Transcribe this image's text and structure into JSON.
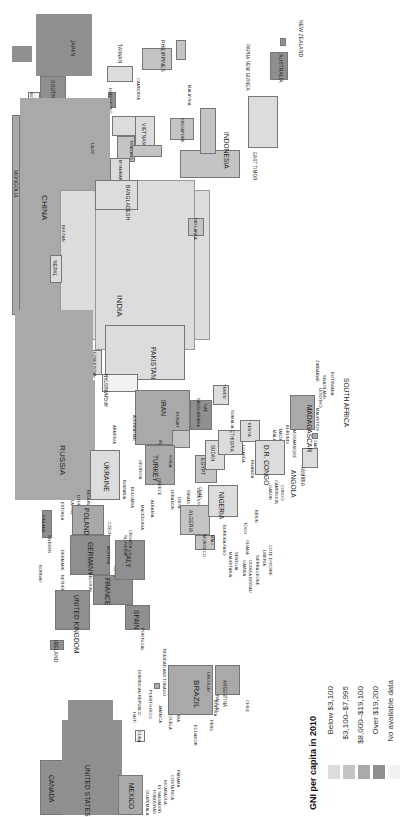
{
  "map": {
    "orientation": "rotated-90-ccw",
    "legend": {
      "title": "GNI per capita in 2010",
      "items": [
        {
          "label": "Below $3,100",
          "color": "#dcdcdc"
        },
        {
          "label": "$3,100–$7,995",
          "color": "#c4c4c4"
        },
        {
          "label": "$8,000–$19,100",
          "color": "#a9a9a9"
        },
        {
          "label": "Over $19,200",
          "color": "#8f8f8f"
        },
        {
          "label": "No available data",
          "color": "#f2f2f2"
        }
      ]
    },
    "regions": {
      "east_asia": [
        "JAPAN",
        "SOUTH KOREA",
        "NORTH KOREA",
        "TAIWAN",
        "HONG KONG",
        "PHILIPPINES",
        "CHINA",
        "MONGOLIA"
      ],
      "southeast_asia": [
        "CAMBODIA",
        "VIETNAM",
        "LAOS",
        "THAILAND",
        "MYANMAR",
        "MALAYSIA",
        "SINGAPORE",
        "INDONESIA",
        "EAST TIMOR",
        "PAPUA NEW GUINEA"
      ],
      "oceania": [
        "AUSTRALIA",
        "NEW ZEALAND"
      ],
      "south_asia": [
        "INDIA",
        "BANGLADESH",
        "NEPAL",
        "BHUTAN",
        "SRI LANKA",
        "PAKISTAN",
        "AFGHANISTAN"
      ],
      "central_asia": [
        "KAZAKHSTAN",
        "KYRGYZSTAN",
        "TAJIKISTAN",
        "UZBEKISTAN",
        "TURKMENISTAN"
      ],
      "middle_east": [
        "IRAN",
        "IRAQ",
        "KUWAIT",
        "SAUDI ARABIA",
        "UAE",
        "OMAN",
        "YEMEN",
        "JORDAN",
        "SYRIA",
        "LEBANON",
        "ISRAEL",
        "GAZA STRIP",
        "WEST BANK",
        "TURKEY",
        "GEORGIA",
        "ARMENIA",
        "AZERBAIJAN"
      ],
      "europe": [
        "RUSSIA",
        "UKRAINE",
        "BELARUS",
        "LITHUANIA",
        "LATVIA",
        "ESTONIA",
        "FINLAND",
        "SWEDEN",
        "NORWAY",
        "DENMARK",
        "POLAND",
        "GERMANY",
        "NETHERLANDS",
        "BELGIUM",
        "UNITED KINGDOM",
        "IRELAND",
        "FRANCE",
        "SWITZERLAND",
        "AUSTRIA",
        "CZECH",
        "HUNGARY",
        "ROMANIA",
        "BULGARIA",
        "MOLDOVA",
        "SERBIA",
        "BOSNIA",
        "CROATIA",
        "SLOVENIA",
        "MACEDONIA",
        "ALBANIA",
        "GREECE",
        "ITALY",
        "SPAIN",
        "PORTUGAL"
      ],
      "africa": [
        "EGYPT",
        "LIBYA",
        "TUNISIA",
        "ALGERIA",
        "MOROCCO",
        "MAURITANIA",
        "MALI",
        "NIGER",
        "CHAD",
        "SUDAN",
        "ERITREA",
        "ETHIOPIA",
        "SOMALIA",
        "KENYA",
        "UGANDA",
        "RWANDA",
        "BURUNDI",
        "TANZANIA",
        "MALAWI",
        "MOZAMBIQUE",
        "ZAMBIA",
        "ZIMBABWE",
        "BOTSWANA",
        "NAMIBIA",
        "SOUTH AFRICA",
        "LESOTHO",
        "SWAZILAND",
        "MADAGASCAR",
        "MAURITIUS",
        "ANGOLA",
        "D.R. CONGO",
        "CONGO",
        "GABON",
        "CAMEROON",
        "NIGERIA",
        "BENIN",
        "TOGO",
        "GHANA",
        "COTE D'IVOIRE",
        "LIBERIA",
        "SIERRA LEONE",
        "GUINEA",
        "GUINEA-BISSAU",
        "GAMBIA",
        "SENEGAL",
        "BURKINA FASO"
      ],
      "americas": [
        "CANADA",
        "UNITED STATES",
        "MEXICO",
        "GUATEMALA",
        "HONDURAS",
        "EL SALVADOR",
        "NICARAGUA",
        "COSTA RICA",
        "PANAMA",
        "CUBA",
        "HAITI",
        "DOMINICAN REPUBLIC",
        "PUERTO RICO",
        "JAMAICA",
        "TRINIDAD AND TOBAGO",
        "VENEZUELA",
        "COLOMBIA",
        "ECUADOR",
        "PERU",
        "BOLIVIA",
        "BRAZIL",
        "PARAGUAY",
        "URUGUAY",
        "ARGENTINA",
        "CHILE"
      ]
    },
    "labels": {
      "japan": "JAPAN",
      "south_korea": "SOUTH KOREA",
      "north_korea": "NORTH KOREA",
      "taiwan": "TAIWAN",
      "hong_kong": "HONG KONG",
      "philippines": "PHILIPPINES",
      "cambodia": "CAMBODIA",
      "vietnam": "VIETNAM",
      "laos": "LAOS",
      "thailand": "THAILAND",
      "myanmar": "MYANMAR",
      "malaysia": "MALAYSIA",
      "singapore": "SINGAPORE",
      "indonesia": "INDONESIA",
      "east_timor": "EAST TIMOR",
      "png": "PAPUA NEW GUINEA",
      "australia": "AUSTRALIA",
      "new_zealand": "NEW ZEALAND",
      "china": "CHINA",
      "mongolia": "MONGOLIA",
      "india": "INDIA",
      "bangladesh": "BANGLADESH",
      "nepal": "NEPAL",
      "bhutan": "BHUTAN",
      "sri_lanka": "SRI LANKA",
      "pakistan": "PAKISTAN",
      "afghanistan": "AFGHANISTAN",
      "kazakhstan": "KAZAKHSTAN",
      "kyrgyzstan": "KYRGYZSTAN",
      "tajikistan": "TAJIKISTAN",
      "uzbekistan": "UZBEKISTAN",
      "turkmenistan": "TURKMENISTAN",
      "russia": "RUSSIA",
      "iran": "IRAN",
      "iraq": "IRAQ",
      "kuwait": "KUWAIT",
      "saudi_arabia": "SAUDI ARABIA",
      "uae": "UAE",
      "oman": "OMAN",
      "yemen": "YEMEN",
      "jordan": "JORDAN",
      "syria": "SYRIA",
      "lebanon": "LEBANON",
      "israel": "ISRAEL",
      "gaza": "GAZA STRIP",
      "west_bank": "WEST BANK",
      "turkey": "TURKEY",
      "georgia": "GEORGIA",
      "armenia": "ARMENIA",
      "azerbaijan": "AZERBAIJAN",
      "ukraine": "UKRAINE",
      "belarus": "BELARUS",
      "lithuania": "LITHUANIA",
      "latvia": "LATVIA",
      "estonia": "ESTONIA",
      "finland": "FINLAND",
      "sweden": "SWEDEN",
      "norway": "NORWAY",
      "denmark": "DENMARK",
      "poland": "POLAND",
      "germany": "GERMANY",
      "netherlands": "NETHERLANDS",
      "belgium": "BELGIUM",
      "uk": "UNITED KINGDOM",
      "ireland": "IRELAND",
      "france": "FRANCE",
      "switzerland": "SWITZ.",
      "austria": "AUSTRIA",
      "czech": "CZECH",
      "hungary": "HUNGARY",
      "romania": "ROMANIA",
      "bulgaria": "BULGARIA",
      "moldova": "MOLDOVA",
      "serbia": "SERBIA",
      "croatia": "CROATIA",
      "slovenia": "SLOVENIA",
      "macedonia": "MACEDONIA",
      "albania": "ALBANIA",
      "greece": "GREECE",
      "italy": "ITALY",
      "spain": "SPAIN",
      "portugal": "PORTUGAL",
      "egypt": "EGYPT",
      "libya": "LIBYA",
      "tunisia": "TUNISIA",
      "algeria": "ALGERIA",
      "morocco": "MOROCCO",
      "mauritania": "MAURITANIA",
      "senegal": "SENEGAL",
      "gambia": "GAMBIA",
      "guinea_bissau": "GUINEA-BISSAU",
      "sierra_leone": "SIERRA LEONE",
      "liberia": "LIBERIA",
      "cote_divoire": "COTE D'IVOIRE",
      "ghana": "GHANA",
      "togo": "TOGO",
      "benin": "BENIN",
      "nigeria": "NIGERIA",
      "chad": "CHAD",
      "mali": "MALI",
      "burkina_faso": "BURKINA FASO",
      "sudan": "SUDAN",
      "eritrea": "ERITREA",
      "ethiopia": "ETHIOPIA",
      "somalia": "SOMALIA",
      "kenya": "KENYA",
      "uganda": "UGANDA",
      "rwanda": "RWANDA",
      "burundi": "BURUNDI",
      "tanzania": "TANZANIA",
      "malawi": "MALAWI",
      "mozambique": "MOZAMBIQUE",
      "gabon": "GABON",
      "cameroon": "CAMEROON",
      "congo": "CONGO",
      "dr_congo": "D.R. CONGO",
      "angola": "ANGOLA",
      "namibia": "NAMIBIA",
      "zambia": "ZAMBIA",
      "zimbabwe": "ZIMBABWE",
      "swaziland": "SWAZILAND",
      "botswana": "BOTSWANA",
      "lesotho": "LESOTHO",
      "south_africa": "SOUTH AFRICA",
      "madagascar": "MADAGASCAR",
      "mauritius": "MAURITIUS",
      "canada": "CANADA",
      "united_states": "UNITED STATES",
      "mexico": "MEXICO",
      "guatemala": "GUATEMALA",
      "honduras": "HONDURAS",
      "el_salvador": "EL SALVADOR",
      "nicaragua": "NICARAGUA",
      "costa_rica": "COSTA RICA",
      "panama": "PANAMA",
      "cuba": "CUBA",
      "haiti": "HAITI",
      "dominican_republic": "DOMINICAN REPUBLIC",
      "puerto_rico": "PUERTO RICO",
      "jamaica": "JAMAICA",
      "trinidad": "TRINIDAD AND TOBAGO",
      "venezuela": "VENEZUELA",
      "colombia": "COLOMBIA",
      "ecuador": "ECUADOR",
      "peru": "PERU",
      "bolivia": "BOLIVIA",
      "brazil": "BRAZIL",
      "paraguay": "PARAGUAY",
      "uruguay": "URUGUAY",
      "argentina": "ARGENTINA",
      "chile": "CHILE"
    }
  }
}
